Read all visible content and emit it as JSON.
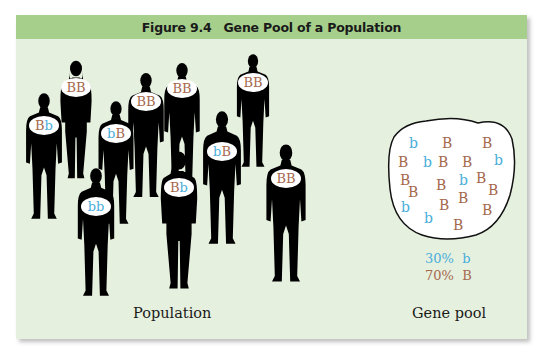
{
  "figure": {
    "number": "Figure 9.4",
    "title": "Gene Pool of a Population"
  },
  "colors": {
    "header_band": "#a6cf8b",
    "panel_background": "#e6f0df",
    "allele_B": "#a5694c",
    "allele_b": "#4aaedb",
    "silhouette": "#000000"
  },
  "population": {
    "caption": "Population",
    "individuals": [
      {
        "id": 1,
        "genotype": [
          "B",
          "b"
        ]
      },
      {
        "id": 2,
        "genotype": [
          "B",
          "B"
        ]
      },
      {
        "id": 3,
        "genotype": [
          "b",
          "B"
        ]
      },
      {
        "id": 4,
        "genotype": [
          "B",
          "B"
        ]
      },
      {
        "id": 5,
        "genotype": [
          "B",
          "B"
        ]
      },
      {
        "id": 6,
        "genotype": [
          "B",
          "B"
        ]
      },
      {
        "id": 7,
        "genotype": [
          "b",
          "B"
        ]
      },
      {
        "id": 8,
        "genotype": [
          "B",
          "b"
        ]
      },
      {
        "id": 9,
        "genotype": [
          "B",
          "B"
        ]
      },
      {
        "id": 10,
        "genotype": [
          "b",
          "b"
        ]
      }
    ]
  },
  "gene_pool": {
    "caption": "Gene pool",
    "alleles": [
      "b",
      "B",
      "B",
      "B",
      "b",
      "B",
      "B",
      "b",
      "B",
      "B",
      "B",
      "b",
      "B",
      "B",
      "B",
      "b",
      "B",
      "B",
      "b",
      "B"
    ],
    "legend": [
      {
        "percent": "30%",
        "allele": "b"
      },
      {
        "percent": "70%",
        "allele": "B"
      }
    ]
  }
}
